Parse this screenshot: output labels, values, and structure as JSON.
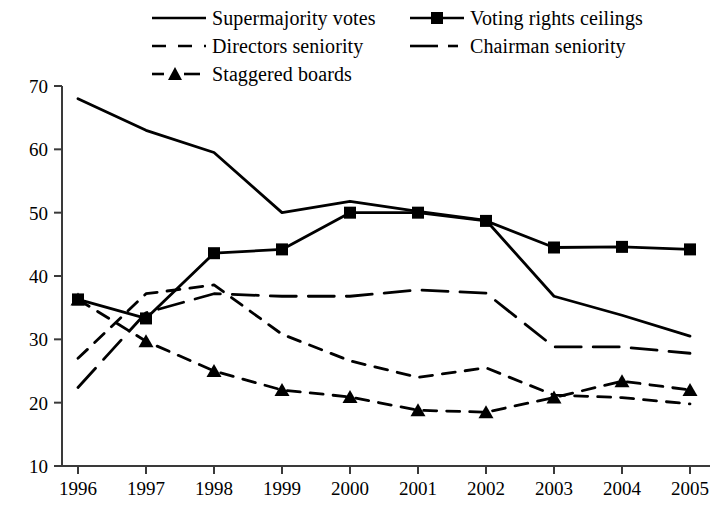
{
  "chart_data": {
    "type": "line",
    "title": "",
    "xlabel": "",
    "ylabel": "",
    "categories": [
      "1996",
      "1997",
      "1998",
      "1999",
      "2000",
      "2001",
      "2002",
      "2003",
      "2004",
      "2005"
    ],
    "x": [
      1996,
      1997,
      1998,
      1999,
      2000,
      2001,
      2002,
      2003,
      2004,
      2005
    ],
    "xlim": [
      1996,
      2005
    ],
    "ylim": [
      10,
      70
    ],
    "yticks": [
      10,
      20,
      30,
      40,
      50,
      60,
      70
    ],
    "ytick_labels": [
      "10",
      "20",
      "30",
      "40",
      "50",
      "60",
      "70"
    ],
    "grid": false,
    "legend_position": "top",
    "series": [
      {
        "name": "Supermajority votes",
        "style": "solid",
        "marker": "none",
        "values": [
          68.0,
          63.0,
          59.5,
          50.0,
          51.8,
          50.2,
          48.8,
          36.8,
          33.8,
          30.5
        ]
      },
      {
        "name": "Voting rights ceilings",
        "style": "solid",
        "marker": "square",
        "values": [
          36.3,
          33.3,
          43.6,
          44.2,
          50.0,
          50.0,
          48.7,
          44.5,
          44.6,
          44.2
        ]
      },
      {
        "name": "Directors seniority",
        "style": "dashed",
        "marker": "none",
        "values": [
          27.0,
          37.2,
          38.6,
          30.8,
          26.6,
          24.0,
          25.5,
          21.2,
          20.8,
          19.8
        ]
      },
      {
        "name": "Chairman seniority",
        "style": "long-dash",
        "marker": "none",
        "values": [
          22.4,
          34.2,
          37.2,
          36.8,
          36.8,
          37.8,
          37.3,
          28.8,
          28.8,
          27.8
        ]
      },
      {
        "name": "Staggered boards",
        "style": "dashed",
        "marker": "triangle",
        "values": [
          36.3,
          29.7,
          25.0,
          22.0,
          20.9,
          18.8,
          18.5,
          20.8,
          23.4,
          22.0
        ]
      }
    ]
  },
  "legend": {
    "items": [
      {
        "label": "Supermajority votes",
        "key": "solid-line-key"
      },
      {
        "label": "Voting rights ceilings",
        "key": "solid-line-square-marker-key"
      },
      {
        "label": "Directors seniority",
        "key": "dashed-line-key"
      },
      {
        "label": "Chairman seniority",
        "key": "long-dash-dot-line-key"
      },
      {
        "label": "Staggered boards",
        "key": "dashed-line-triangle-marker-key"
      }
    ]
  },
  "axes": {
    "y_tick_labels": [
      "70",
      "60",
      "50",
      "40",
      "30",
      "20",
      "10"
    ],
    "x_tick_labels": [
      "1996",
      "1997",
      "1998",
      "1999",
      "2000",
      "2001",
      "2002",
      "2003",
      "2004",
      "2005"
    ]
  },
  "colors": {
    "line": "#000000",
    "axis": "#444444",
    "background": "#ffffff"
  }
}
